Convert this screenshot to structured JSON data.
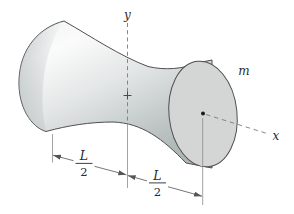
{
  "diagram": {
    "labels": {
      "y_axis": "y",
      "x_axis": "x",
      "mass": "m"
    },
    "dimensions": {
      "left": {
        "numerator": "L",
        "denominator": "2"
      },
      "right": {
        "numerator": "L",
        "denominator": "2"
      }
    },
    "colors": {
      "background": "#ffffff",
      "outline": "#4f4f4f",
      "body_highlight": "#fbfbfb",
      "body_shadow": "#aeb6b6",
      "face_fill": "#d4d6d6",
      "construction_line": "#7a7a7a"
    }
  }
}
